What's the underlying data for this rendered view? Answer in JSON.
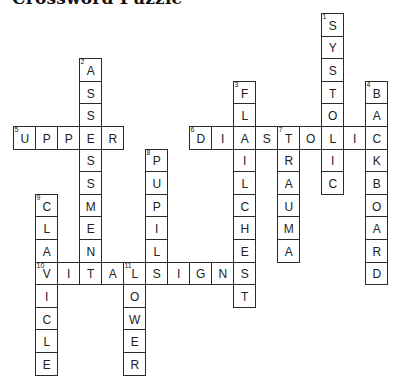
{
  "title": "Crossword Puzzle",
  "grid": {
    "origin_x": 13,
    "origin_y": 13,
    "cell_w": 22,
    "cell_h": 22.6
  },
  "words": [
    {
      "number": 1,
      "direction": "down",
      "answer": "SYSTOLIC",
      "row": 0,
      "col": 14
    },
    {
      "number": 2,
      "direction": "down",
      "answer": "ASSESSMENT",
      "row": 2,
      "col": 3
    },
    {
      "number": 3,
      "direction": "down",
      "answer": "FLAILCHEST",
      "row": 3,
      "col": 10
    },
    {
      "number": 4,
      "direction": "down",
      "answer": "BACKBOARD",
      "row": 3,
      "col": 16
    },
    {
      "number": 5,
      "direction": "across",
      "answer": "UPPER",
      "row": 5,
      "col": 0
    },
    {
      "number": 6,
      "direction": "across",
      "answer": "DIASTOLIC",
      "row": 5,
      "col": 8
    },
    {
      "number": 7,
      "direction": "down",
      "answer": "TRAUMA",
      "row": 5,
      "col": 12
    },
    {
      "number": 8,
      "direction": "down",
      "answer": "PUPIL",
      "row": 6,
      "col": 6
    },
    {
      "number": 9,
      "direction": "down",
      "answer": "CLAVICLE",
      "row": 8,
      "col": 1
    },
    {
      "number": 10,
      "direction": "across",
      "answer": "VITALSIGNS",
      "row": 11,
      "col": 1
    },
    {
      "number": 11,
      "direction": "down",
      "answer": "LOWER",
      "row": 11,
      "col": 5
    }
  ]
}
